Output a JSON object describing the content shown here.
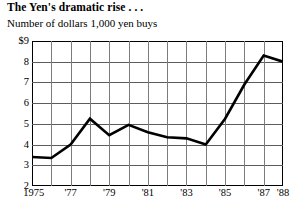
{
  "chart": {
    "title": "The Yen's dramatic rise . . .",
    "subtitle": "Number of dollars 1,000 yen buys"
  },
  "chart_data": {
    "type": "line",
    "title": "The Yen's dramatic rise . . .",
    "subtitle": "Number of dollars 1,000 yen buys",
    "xlabel": "",
    "ylabel": "Number of dollars 1,000 yen buys",
    "x": [
      1975,
      1976,
      1977,
      1978,
      1979,
      1980,
      1981,
      1982,
      1983,
      1984,
      1985,
      1986,
      1987,
      1988
    ],
    "values": [
      3.4,
      3.35,
      4.0,
      5.25,
      4.45,
      4.95,
      4.6,
      4.35,
      4.3,
      4.0,
      5.25,
      6.9,
      8.3,
      8.0
    ],
    "ylim": [
      2,
      9
    ],
    "xlim": [
      1975,
      1988
    ],
    "yticks": [
      2,
      3,
      4,
      5,
      6,
      7,
      8,
      9
    ],
    "ytick_labels": [
      "2",
      "3",
      "4",
      "5",
      "6",
      "7",
      "8",
      "$9"
    ],
    "xtick_values": [
      1975,
      1977,
      1979,
      1981,
      1983,
      1985,
      1987,
      1988
    ],
    "xtick_labels": [
      "1975",
      "'77",
      "'79",
      "'81",
      "'83",
      "'85",
      "'87",
      "'88"
    ],
    "grid": true,
    "legend": false,
    "line_color": "#000000",
    "grid_color": "#5c5c5c"
  }
}
